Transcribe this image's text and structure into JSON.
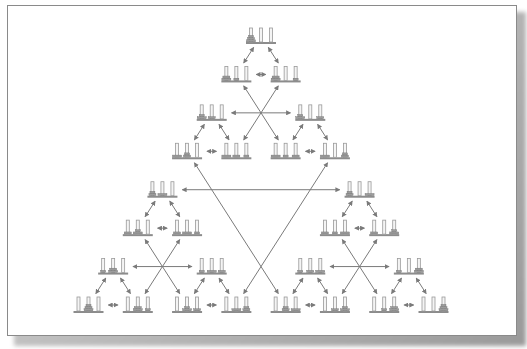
{
  "diagram": {
    "colors": {
      "rod": "#9a9a9a",
      "rod_fill": "#f4f4f4",
      "base": "#8c8c8c",
      "disk": "#9c9c9c",
      "arrow": "#7a7a7a",
      "frame_border": "#8a8a8a"
    },
    "node_size": {
      "width": 30,
      "height": 16
    },
    "top": {
      "x": 261,
      "y": 44
    },
    "bottom_left": {
      "x": 88,
      "y": 313
    },
    "bottom_right": {
      "x": 433,
      "y": 313
    },
    "levels": 8,
    "num_disks": 3,
    "pegs": [
      "A",
      "B",
      "C"
    ]
  }
}
